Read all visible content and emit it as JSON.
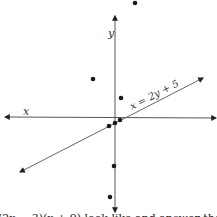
{
  "diagram": {
    "axes": {
      "x_label": "x",
      "y_label": "y",
      "color": "#555555"
    },
    "line": {
      "label": "x = 2y + 5",
      "color": "#666666"
    },
    "points": [
      {
        "x": 135,
        "y": 3
      },
      {
        "x": 93,
        "y": 79
      },
      {
        "x": 121,
        "y": 98
      },
      {
        "x": 120,
        "y": 120
      },
      {
        "x": 115,
        "y": 123
      },
      {
        "x": 109,
        "y": 126
      },
      {
        "x": 114,
        "y": 166
      },
      {
        "x": 110,
        "y": 197
      }
    ],
    "point_color": "#1a1a1a",
    "caption_partial": "(2x − 3)(x + 9) look like and answer the"
  }
}
